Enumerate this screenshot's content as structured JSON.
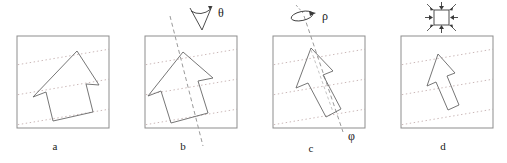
{
  "figure": {
    "title": "",
    "panel_count": 4,
    "background_color": "#ffffff",
    "stroke_color": "#555555",
    "frame_color": "#888888",
    "dotted_line_color": "#cbb8b8",
    "dashed_axis_color": "#9a9a9a"
  },
  "panels": [
    {
      "id": "a",
      "label": "a",
      "caption_label": "a",
      "transform": "shear",
      "box": {
        "x": 17,
        "y": 36,
        "w": 92,
        "h": 92
      },
      "shape": "arrow",
      "shape_name": "sheared-arrow",
      "annotation_symbol": "",
      "annotation_icon": "none",
      "dotted_lines": 3,
      "dotted_slope_deg": -9,
      "axis_line": false
    },
    {
      "id": "b",
      "label": "b",
      "caption_label": "b",
      "transform": "rotation-in-plane",
      "box": {
        "x": 145,
        "y": 36,
        "w": 92,
        "h": 92
      },
      "shape": "arrow",
      "shape_name": "rotated-arrow",
      "annotation_symbol": "θ",
      "annotation_icon": "angle-wedge-icon",
      "dotted_lines": 3,
      "dotted_slope_deg": -9,
      "axis_line": true,
      "axis_label": ""
    },
    {
      "id": "c",
      "label": "c",
      "caption_label": "c",
      "transform": "rotation-about-axis",
      "box": {
        "x": 273,
        "y": 36,
        "w": 92,
        "h": 92
      },
      "shape": "arrow",
      "shape_name": "foreshortened-arrow",
      "annotation_symbol": "ρ",
      "annotation_icon": "rotation-arrow-icon",
      "axis_symbol": "φ",
      "dotted_lines": 3,
      "dotted_slope_deg": -9,
      "axis_line": true
    },
    {
      "id": "d",
      "label": "d",
      "caption_label": "d",
      "transform": "scaling",
      "box": {
        "x": 401,
        "y": 36,
        "w": 92,
        "h": 92
      },
      "shape": "arrow",
      "shape_name": "scaled-arrow",
      "annotation_symbol": "",
      "annotation_icon": "scale-square-icon",
      "dotted_lines": 3,
      "dotted_slope_deg": -9,
      "axis_line": false
    }
  ],
  "symbols": {
    "theta": "θ",
    "rho": "ρ",
    "phi": "φ"
  },
  "labels": {
    "a": "a",
    "b": "b",
    "c": "c",
    "d": "d"
  }
}
